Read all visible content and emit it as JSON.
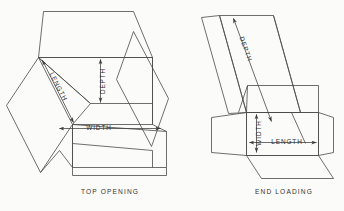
{
  "figure": {
    "background_color": "#fbfbf9",
    "line_color": "#4a4a4a",
    "text_color": "#2e2e2e"
  },
  "left_figure": {
    "caption": "TOP OPENING",
    "dimensions": {
      "length": "LENGTH",
      "depth": "DEPTH",
      "width": "WIDTH"
    }
  },
  "right_figure": {
    "caption": "END  LOADING",
    "dimensions": {
      "depth": "DEPTH",
      "width": "WIDTH",
      "length": "LENGTH"
    }
  }
}
